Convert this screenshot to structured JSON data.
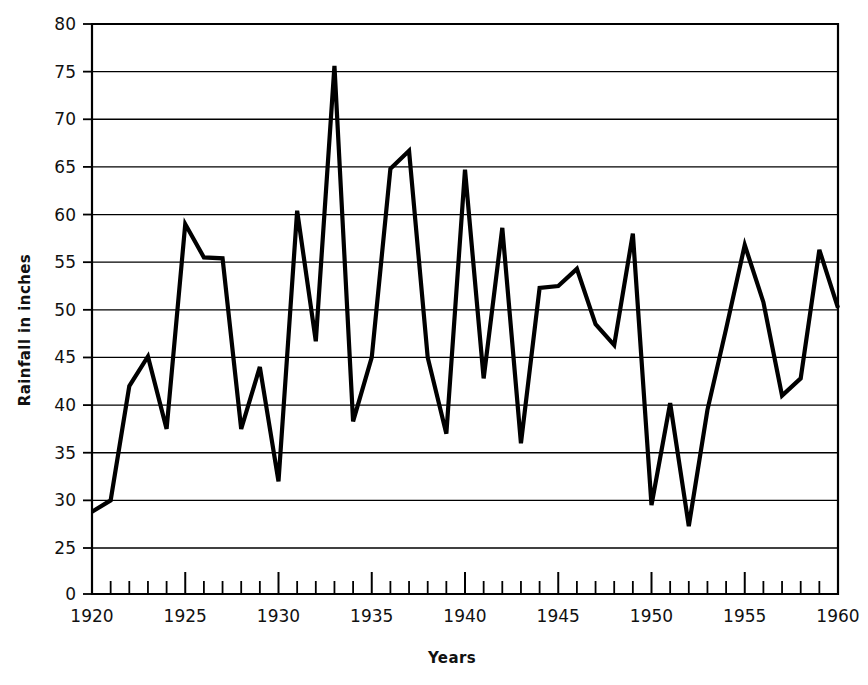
{
  "chart_data": {
    "type": "line",
    "title": "",
    "xlabel": "Years",
    "ylabel": "Rainfall in inches",
    "xlim": [
      1920,
      1960
    ],
    "ylim": [
      25,
      80
    ],
    "grid": true,
    "legend": "none",
    "y_axis_origin_label": "0",
    "y_axis_break": true,
    "x_tick_labels": [
      "1920",
      "1925",
      "1930",
      "1935",
      "1940",
      "1945",
      "1950",
      "1955",
      "1960"
    ],
    "x_major_ticks": [
      1920,
      1925,
      1930,
      1935,
      1940,
      1945,
      1950,
      1955,
      1960
    ],
    "x_minor_tick_interval": 1,
    "y_tick_labels": [
      "0",
      "25",
      "30",
      "35",
      "40",
      "45",
      "50",
      "55",
      "60",
      "65",
      "70",
      "75",
      "80"
    ],
    "y_gridline_values": [
      25,
      30,
      35,
      40,
      45,
      50,
      55,
      60,
      65,
      70,
      75,
      80
    ],
    "line_color": "#000000",
    "x": [
      1920,
      1921,
      1922,
      1923,
      1924,
      1925,
      1926,
      1927,
      1928,
      1929,
      1930,
      1931,
      1932,
      1933,
      1934,
      1935,
      1936,
      1937,
      1938,
      1939,
      1940,
      1941,
      1942,
      1943,
      1944,
      1945,
      1946,
      1947,
      1948,
      1949,
      1950,
      1951,
      1952,
      1953,
      1954,
      1955,
      1956,
      1957,
      1958,
      1959,
      1960
    ],
    "values": [
      28.8,
      30.0,
      42.0,
      45.1,
      37.5,
      59.0,
      55.5,
      55.4,
      37.5,
      44.0,
      32.0,
      60.4,
      46.7,
      75.6,
      38.3,
      45.0,
      64.8,
      66.7,
      45.0,
      37.0,
      64.7,
      42.8,
      58.6,
      36.0,
      52.3,
      52.5,
      54.3,
      48.5,
      46.3,
      58.0,
      29.5,
      40.2,
      27.3,
      39.5,
      48.0,
      56.8,
      50.8,
      41.0,
      42.8,
      56.3,
      50.2
    ],
    "series": [
      {
        "name": "Rainfall",
        "values": [
          28.8,
          30.0,
          42.0,
          45.1,
          37.5,
          59.0,
          55.5,
          55.4,
          37.5,
          44.0,
          32.0,
          60.4,
          46.7,
          75.6,
          38.3,
          45.0,
          64.8,
          66.7,
          45.0,
          37.0,
          64.7,
          42.8,
          58.6,
          36.0,
          52.3,
          52.5,
          54.3,
          48.5,
          46.3,
          58.0,
          29.5,
          40.2,
          27.3,
          39.5,
          48.0,
          56.8,
          50.8,
          41.0,
          42.8,
          56.3,
          50.2
        ]
      }
    ]
  }
}
